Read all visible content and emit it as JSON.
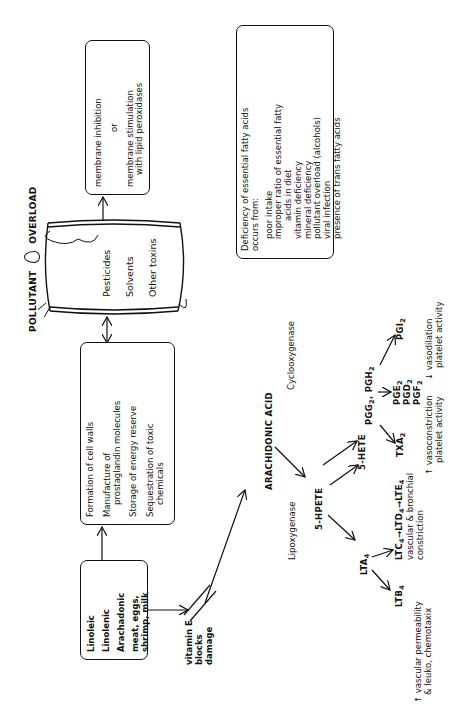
{
  "title": {
    "left": "POLLUTANT",
    "right": "OVERLOAD",
    "icon": "flame-drop-icon"
  },
  "barrel": {
    "icon": "toxic-barrel-icon",
    "items": [
      "Pesticides",
      "Solvents",
      "Other toxins"
    ]
  },
  "membrane_box": {
    "lines": [
      "membrane inhibition",
      "or",
      "membrane stimulation",
      "with lipid peroxidases"
    ]
  },
  "functions_box": {
    "items": [
      {
        "line1": "Formation of cell walls",
        "line2": ""
      },
      {
        "line1": "Manufacture of",
        "line2": "prostaglandin molecules"
      },
      {
        "line1": "Storage of energy reserve",
        "line2": ""
      },
      {
        "line1": "Sequestration of toxic",
        "line2": "chemicals"
      }
    ]
  },
  "deficiency_box": {
    "heading1": "Deficiency of essential fatty acids",
    "heading2": "occurs from:",
    "causes": [
      "poor intake",
      "improper ratio of essential fatty",
      "acids in diet",
      "vitamin deficiency",
      "mineral deficiency",
      "pollutant overload (alcohols)",
      "viral infection",
      "presence of trans fatty acids"
    ]
  },
  "sources_box": {
    "acids": [
      "Linoleic",
      "Linolenic",
      "Arachadonic"
    ],
    "foods_line1": "meat, eggs,",
    "foods_line2": "shrimp, milk"
  },
  "vitamin_e": {
    "lines": [
      "vitamin E",
      "blocks",
      "damage"
    ]
  },
  "pathway": {
    "arachidonic_acid": "ARACHIDONIC ACID",
    "lipoxygenase": "Lipoxygenase",
    "cyclooxygenase": "Cyclooxygenase",
    "hpete": "5-HPETE",
    "hete": "5-HETE",
    "lta4": {
      "base": "LTA",
      "sub": "4"
    },
    "ltb4": {
      "base": "LTB",
      "sub": "4"
    },
    "ltc_chain": {
      "c": "LTC",
      "c_sub": "4",
      "d": "LTD",
      "d_sub": "4",
      "e": "LTE",
      "e_sub": "4",
      "arrow": "→"
    },
    "pgg_pgh": {
      "pgg": "PGG",
      "pgg_sub": "2",
      "sep": ", ",
      "pgh": "PGH",
      "pgh_sub": "2"
    },
    "pge2": {
      "base": "PGE",
      "sub": "2"
    },
    "pgd2": {
      "base": "PGD",
      "sub": "2"
    },
    "pgf2": {
      "base": "PGF",
      "sub": "2"
    },
    "txa2": {
      "base": "TXA",
      "sub": "2"
    },
    "pgi2": {
      "base": "PGI",
      "sub": "2"
    }
  },
  "effects": {
    "ltb4_effect": {
      "line1": "↑ vascular permeability",
      "line2": "& leuko, chemotaxix"
    },
    "ltc_effect": {
      "line1": "vascular & bronchial",
      "line2": "constriction"
    },
    "txa2_effect": {
      "line1": "↑ vasoconstriction",
      "line2": "platelet activity"
    },
    "pgi2_effect": {
      "line1": "↓ vasodilation",
      "line2": "platelet activity"
    }
  }
}
